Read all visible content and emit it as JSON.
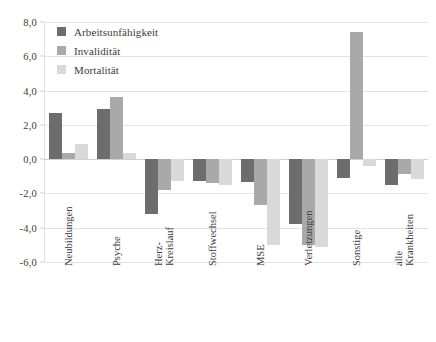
{
  "chart_data": {
    "type": "bar",
    "title": "",
    "subtitle": "",
    "xlabel": "",
    "ylabel": "",
    "ylim": [
      -6.0,
      8.0
    ],
    "ytick_step": 2.0,
    "ytick_labels": [
      "8,0",
      "6,0",
      "4,0",
      "2,0",
      "0,0",
      "-2,0",
      "-4,0",
      "-6,0"
    ],
    "ytick_values": [
      8.0,
      6.0,
      4.0,
      2.0,
      0.0,
      -2.0,
      -4.0,
      -6.0
    ],
    "grid": "horizontal",
    "legend_position": "top-left-inside",
    "categories": [
      "Neubildungen",
      "Psyche",
      "Herz-\nKreislauf",
      "Stoffwechsel",
      "MSE",
      "Verletzungen",
      "Sonstige",
      "alle\nKrankheiten"
    ],
    "category_lines": [
      [
        "Neubildungen"
      ],
      [
        "Psyche"
      ],
      [
        "Herz-",
        "Kreislauf"
      ],
      [
        "Stoffwechsel"
      ],
      [
        "MSE"
      ],
      [
        "Verletzungen"
      ],
      [
        "Sonstige"
      ],
      [
        "alle",
        "Krankheiten"
      ]
    ],
    "series": [
      {
        "name": "Arbeitsunfähigkeit",
        "color": "#6d6d6d",
        "values": [
          2.7,
          2.9,
          -3.2,
          -1.3,
          -1.35,
          -3.8,
          -1.1,
          -1.5
        ]
      },
      {
        "name": "Invalidität",
        "color": "#a9a9a9",
        "values": [
          0.35,
          3.6,
          -1.8,
          -1.4,
          -2.7,
          -5.0,
          7.4,
          -0.85
        ]
      },
      {
        "name": "Mortalität",
        "color": "#d9d9d9",
        "values": [
          0.9,
          0.35,
          -1.3,
          -1.5,
          -5.0,
          -5.1,
          -0.4,
          -1.15
        ]
      }
    ]
  },
  "legend": {
    "items": [
      {
        "label": "Arbeitsunfähigkeit",
        "color": "#6d6d6d"
      },
      {
        "label": "Invalidität",
        "color": "#a9a9a9"
      },
      {
        "label": "Mortalität",
        "color": "#d9d9d9"
      }
    ]
  }
}
